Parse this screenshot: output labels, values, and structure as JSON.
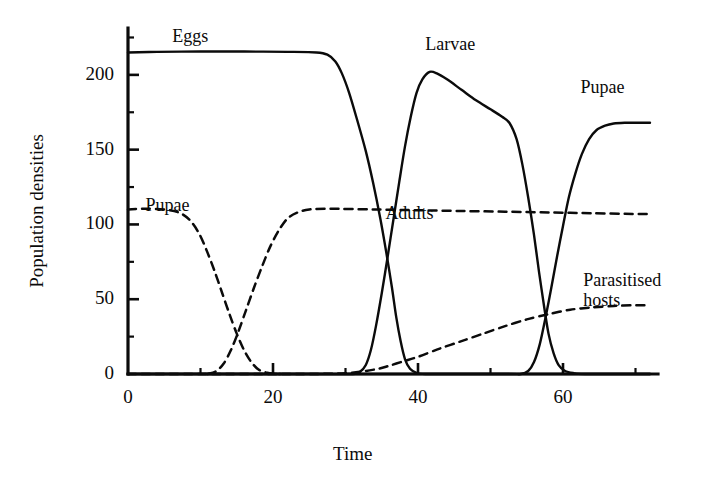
{
  "figure": {
    "background_color": "#ffffff",
    "ink_color": "#0b0b0b",
    "xlabel": "Time",
    "ylabel": "Population densities"
  },
  "bleed_text": {
    "lines": [
      "a few minutes in some other way; in any case,",
      "of 1966 (Varley and Gradwell 1968) was per cent of eggs of",
      "a considerable number of larvae per host egg.",
      "Direct measurement of the development of insects is possible",
      "by using the methods of Varley, Gradwell and Hassell",
      "the rate at which hosts are parasitised and the",
      "generation. This means that the whole of the",
      "that the population is sampled at the same time",
      "in each generation, with a known number of hosts.",
      "densities can be estimated directly from the",
      "numbers of hosts and parasites collected in the",
      "samples. A computer simulation of this system shows",
      "how the measured densities change through time.",
      "of this kind of model has been attempted by several",
      "authors. Hassell (1978) reviews these attempts and gives",
      "a large number of additional figures, calculated in"
    ]
  },
  "chart_data": {
    "type": "line",
    "title": "",
    "xlabel": "Time",
    "ylabel": "Population densities",
    "xlim": [
      0,
      72
    ],
    "ylim": [
      0,
      230
    ],
    "xticks": [
      0,
      20,
      40,
      60
    ],
    "xticks_minor": [
      10,
      30,
      50,
      70
    ],
    "yticks": [
      0,
      50,
      100,
      150,
      200
    ],
    "yticks_minor": [
      25,
      75,
      125,
      175,
      225
    ],
    "grid": false,
    "legend": "inline-annotations",
    "annotations": [
      {
        "id": "eggs",
        "text": "Eggs",
        "x": 6.1,
        "y": 225
      },
      {
        "id": "larvae",
        "text": "Larvae",
        "x": 41.0,
        "y": 220
      },
      {
        "id": "pupae-right",
        "text": "Pupae",
        "x": 62.4,
        "y": 191
      },
      {
        "id": "pupae-left",
        "text": "Pupae",
        "x": 2.4,
        "y": 112
      },
      {
        "id": "adults",
        "text": "Adults",
        "x": 35.5,
        "y": 107
      },
      {
        "id": "parasitised-hosts",
        "text": "Parasitised\nhosts",
        "x": 62.8,
        "y": 62
      }
    ],
    "series": [
      {
        "name": "Eggs",
        "style": "solid",
        "color": "#0b0b0b",
        "points": [
          [
            0,
            215
          ],
          [
            4,
            215.4
          ],
          [
            10,
            215.6
          ],
          [
            16,
            215.6
          ],
          [
            22,
            215.4
          ],
          [
            26,
            215
          ],
          [
            27.5,
            213.5
          ],
          [
            28.6,
            209
          ],
          [
            29.5,
            201
          ],
          [
            30.5,
            188
          ],
          [
            31.6,
            170
          ],
          [
            32.8,
            149
          ],
          [
            33.8,
            128
          ],
          [
            34.8,
            104
          ],
          [
            35.6,
            82
          ],
          [
            36.4,
            58
          ],
          [
            37.0,
            38
          ],
          [
            37.6,
            22
          ],
          [
            38.2,
            10
          ],
          [
            38.9,
            3.5
          ],
          [
            39.8,
            0.8
          ],
          [
            41,
            0
          ],
          [
            48,
            0
          ],
          [
            60,
            0
          ],
          [
            72,
            0
          ]
        ]
      },
      {
        "name": "Larvae",
        "style": "solid",
        "color": "#0b0b0b",
        "points": [
          [
            0,
            0
          ],
          [
            14,
            0
          ],
          [
            26,
            0
          ],
          [
            31.0,
            0
          ],
          [
            32.0,
            1.5
          ],
          [
            32.8,
            6
          ],
          [
            33.5,
            16
          ],
          [
            34.2,
            32
          ],
          [
            35.0,
            54
          ],
          [
            35.8,
            78
          ],
          [
            36.6,
            103
          ],
          [
            37.4,
            128
          ],
          [
            38.2,
            152
          ],
          [
            39.0,
            172
          ],
          [
            39.8,
            188
          ],
          [
            40.6,
            197
          ],
          [
            41.6,
            202
          ],
          [
            42.6,
            201
          ],
          [
            44.0,
            197
          ],
          [
            46.0,
            190
          ],
          [
            48.0,
            183
          ],
          [
            50.0,
            177
          ],
          [
            51.6,
            172
          ],
          [
            52.6,
            168
          ],
          [
            53.6,
            157
          ],
          [
            54.4,
            140
          ],
          [
            55.2,
            118
          ],
          [
            56.0,
            93
          ],
          [
            56.7,
            68
          ],
          [
            57.4,
            45
          ],
          [
            58.0,
            27
          ],
          [
            58.7,
            14
          ],
          [
            59.4,
            6
          ],
          [
            60.3,
            2
          ],
          [
            61.5,
            0.6
          ],
          [
            63,
            0
          ],
          [
            72,
            0
          ]
        ]
      },
      {
        "name": "Pupae",
        "style": "solid",
        "color": "#0b0b0b",
        "points": [
          [
            0,
            0
          ],
          [
            20,
            0
          ],
          [
            40,
            0
          ],
          [
            52,
            0
          ],
          [
            54.2,
            0
          ],
          [
            55.2,
            2
          ],
          [
            56.0,
            8
          ],
          [
            56.8,
            20
          ],
          [
            57.6,
            38
          ],
          [
            58.4,
            58
          ],
          [
            59.2,
            79
          ],
          [
            60.0,
            99
          ],
          [
            60.8,
            118
          ],
          [
            61.7,
            134
          ],
          [
            62.6,
            147
          ],
          [
            63.6,
            157
          ],
          [
            64.6,
            163
          ],
          [
            65.8,
            166
          ],
          [
            67.0,
            167.5
          ],
          [
            68.5,
            168
          ],
          [
            70,
            168
          ],
          [
            72,
            168
          ]
        ]
      },
      {
        "name": "Adults",
        "style": "dashed",
        "color": "#0b0b0b",
        "points": [
          [
            0,
            110
          ],
          [
            2.5,
            110.5
          ],
          [
            5.0,
            110
          ],
          [
            7.0,
            108
          ],
          [
            8.5,
            103
          ],
          [
            9.8,
            94
          ],
          [
            10.9,
            82
          ],
          [
            12.0,
            68
          ],
          [
            13.0,
            54
          ],
          [
            14.0,
            40
          ],
          [
            15.0,
            27
          ],
          [
            16.0,
            16
          ],
          [
            17.0,
            8
          ],
          [
            18.0,
            3
          ],
          [
            19.2,
            0.8
          ],
          [
            20.6,
            0
          ],
          [
            21.0,
            0
          ],
          [
            13.5,
            null
          ]
        ],
        "note": "adults-first-branch-declining"
      },
      {
        "name": "Adults-rise",
        "style": "dashed",
        "color": "#0b0b0b",
        "points": [
          [
            11.0,
            0
          ],
          [
            12.2,
            2
          ],
          [
            13.2,
            7
          ],
          [
            14.2,
            16
          ],
          [
            15.2,
            28
          ],
          [
            16.3,
            43
          ],
          [
            17.4,
            58
          ],
          [
            18.5,
            72
          ],
          [
            19.6,
            85
          ],
          [
            20.8,
            96
          ],
          [
            22.0,
            104
          ],
          [
            23.4,
            108
          ],
          [
            25.0,
            110
          ],
          [
            28,
            110.5
          ],
          [
            34,
            110
          ],
          [
            40,
            109.5
          ],
          [
            46,
            109
          ],
          [
            52,
            108.5
          ],
          [
            58,
            108
          ],
          [
            64,
            107.5
          ],
          [
            70,
            107
          ],
          [
            72,
            107
          ]
        ],
        "note": "adults-plateau-branch"
      },
      {
        "name": "Parasitised hosts",
        "style": "dashed",
        "color": "#0b0b0b",
        "points": [
          [
            0,
            0
          ],
          [
            14,
            0
          ],
          [
            24,
            0
          ],
          [
            30,
            0.5
          ],
          [
            34,
            3
          ],
          [
            36,
            5.5
          ],
          [
            38,
            8.5
          ],
          [
            40,
            11.5
          ],
          [
            43,
            17
          ],
          [
            46,
            22
          ],
          [
            49,
            27
          ],
          [
            52,
            32
          ],
          [
            55,
            36.5
          ],
          [
            58,
            40
          ],
          [
            61,
            43
          ],
          [
            64,
            44.5
          ],
          [
            67,
            45.5
          ],
          [
            70,
            46
          ],
          [
            72,
            46
          ]
        ]
      }
    ]
  },
  "geometry": {
    "plot_left_px": 128,
    "plot_right_px": 650,
    "plot_bottom_px": 374,
    "plot_top_px": 30
  }
}
